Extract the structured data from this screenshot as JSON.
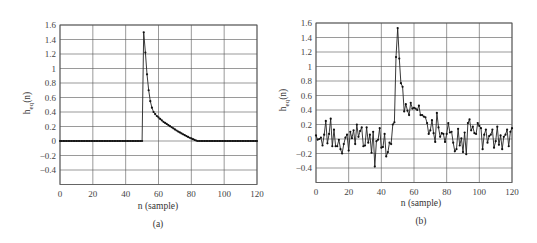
{
  "chart_data": [
    {
      "id": "a",
      "type": "line",
      "caption": "(a)",
      "title": "",
      "xlabel": "n (sample)",
      "ylabel": "h",
      "ylabel_sub": "eq",
      "ylabel_suffix": "(n)",
      "xlim": [
        0,
        120
      ],
      "ylim": [
        -0.6,
        1.6
      ],
      "xticks": [
        0,
        20,
        40,
        60,
        80,
        100,
        120
      ],
      "yticks": [
        -0.4,
        -0.2,
        0,
        0.2,
        0.4,
        0.6,
        0.8,
        1,
        1.2,
        1.4,
        1.6
      ],
      "ytick_labels": [
        "-0.4",
        "-0.2",
        "0",
        "0.2",
        "0.4",
        "0.6",
        "0.8",
        "1",
        "1.2",
        "1.4",
        "1.6"
      ],
      "grid": true,
      "legend": null,
      "marker": "dot",
      "x": [
        0,
        1,
        2,
        3,
        4,
        5,
        6,
        7,
        8,
        9,
        10,
        11,
        12,
        13,
        14,
        15,
        16,
        17,
        18,
        19,
        20,
        21,
        22,
        23,
        24,
        25,
        26,
        27,
        28,
        29,
        30,
        31,
        32,
        33,
        34,
        35,
        36,
        37,
        38,
        39,
        40,
        41,
        42,
        43,
        44,
        45,
        46,
        47,
        48,
        49,
        50,
        51,
        52,
        53,
        54,
        55,
        56,
        57,
        58,
        59,
        60,
        61,
        62,
        63,
        64,
        65,
        66,
        67,
        68,
        69,
        70,
        71,
        72,
        73,
        74,
        75,
        76,
        77,
        78,
        79,
        80,
        81,
        82,
        83,
        84,
        85,
        86,
        87,
        88,
        89,
        90,
        91,
        92,
        93,
        94,
        95,
        96,
        97,
        98,
        99,
        100,
        101,
        102,
        103,
        104,
        105,
        106,
        107,
        108,
        109,
        110,
        111,
        112,
        113,
        114,
        115,
        116,
        117,
        118,
        119,
        120
      ],
      "values": [
        0,
        0,
        0,
        0,
        0,
        0,
        0,
        0,
        0,
        0,
        0,
        0,
        0,
        0,
        0,
        0,
        0,
        0,
        0,
        0,
        0,
        0,
        0,
        0,
        0,
        0,
        0,
        0,
        0,
        0,
        0,
        0,
        0,
        0,
        0,
        0,
        0,
        0,
        0,
        0,
        0,
        0,
        0,
        0,
        0,
        0,
        0,
        0,
        0,
        0,
        0,
        1.5,
        1.22,
        0.92,
        0.7,
        0.55,
        0.46,
        0.4,
        0.37,
        0.345,
        0.325,
        0.305,
        0.285,
        0.265,
        0.25,
        0.235,
        0.22,
        0.205,
        0.19,
        0.175,
        0.16,
        0.145,
        0.13,
        0.118,
        0.105,
        0.092,
        0.08,
        0.068,
        0.056,
        0.045,
        0.035,
        0.025,
        0.015,
        0.006,
        0,
        0,
        0,
        0,
        0,
        0,
        0,
        0,
        0,
        0,
        0,
        0,
        0,
        0,
        0,
        0,
        0,
        0,
        0,
        0,
        0,
        0,
        0,
        0,
        0,
        0,
        0,
        0,
        0,
        0,
        0,
        0,
        0,
        0,
        0,
        0,
        0
      ]
    },
    {
      "id": "b",
      "type": "line",
      "caption": "(b)",
      "title": "",
      "xlabel": "n (sample)",
      "ylabel": "h",
      "ylabel_sub": "eq",
      "ylabel_suffix": "(n)",
      "xlim": [
        0,
        120
      ],
      "ylim": [
        -0.6,
        1.6
      ],
      "xticks": [
        0,
        20,
        40,
        60,
        80,
        100,
        120
      ],
      "yticks": [
        -0.4,
        -0.2,
        0,
        0.2,
        0.4,
        0.6,
        0.8,
        1,
        1.2,
        1.4,
        1.6
      ],
      "ytick_labels": [
        "-0.4",
        "-0.2",
        "0",
        "0.2",
        "0.4",
        "0.6",
        "0.8",
        "1",
        "1.2",
        "1.4",
        "1.6"
      ],
      "grid": true,
      "legend": null,
      "marker": "dot",
      "x": [
        0,
        1,
        2,
        3,
        4,
        5,
        6,
        7,
        8,
        9,
        10,
        11,
        12,
        13,
        14,
        15,
        16,
        17,
        18,
        19,
        20,
        21,
        22,
        23,
        24,
        25,
        26,
        27,
        28,
        29,
        30,
        31,
        32,
        33,
        34,
        35,
        36,
        37,
        38,
        39,
        40,
        41,
        42,
        43,
        44,
        45,
        46,
        47,
        48,
        49,
        50,
        51,
        52,
        53,
        54,
        55,
        56,
        57,
        58,
        59,
        60,
        61,
        62,
        63,
        64,
        65,
        66,
        67,
        68,
        69,
        70,
        71,
        72,
        73,
        74,
        75,
        76,
        77,
        78,
        79,
        80,
        81,
        82,
        83,
        84,
        85,
        86,
        87,
        88,
        89,
        90,
        91,
        92,
        93,
        94,
        95,
        96,
        97,
        98,
        99,
        100,
        101,
        102,
        103,
        104,
        105,
        106,
        107,
        108,
        109,
        110,
        111,
        112,
        113,
        114,
        115,
        116,
        117,
        118,
        119,
        120
      ],
      "values": [
        0.05,
        -0.01,
        0.0,
        0.02,
        -0.09,
        0.06,
        0.25,
        -0.06,
        0.07,
        0.28,
        -0.1,
        0.13,
        -0.1,
        -0.1,
        -0.01,
        -0.14,
        -0.2,
        -0.07,
        0.02,
        0.06,
        -0.16,
        0.1,
        0.01,
        0.12,
        -0.07,
        0.2,
        0.03,
        0.11,
        0.16,
        -0.1,
        -0.09,
        0.16,
        -0.05,
        0.06,
        -0.19,
        0.1,
        -0.38,
        -0.03,
        -0.01,
        0.15,
        -0.12,
        -0.11,
        0.07,
        -0.24,
        -0.18,
        -0.05,
        -0.07,
        0.2,
        0.23,
        1.13,
        1.53,
        1.11,
        0.77,
        0.72,
        0.38,
        0.48,
        0.39,
        0.33,
        0.5,
        0.42,
        0.43,
        0.42,
        0.4,
        0.46,
        0.33,
        0.33,
        0.31,
        0.3,
        0.22,
        0.07,
        0.12,
        0.26,
        0.08,
        -0.04,
        0.36,
        0.16,
        0.03,
        0.08,
        0.07,
        -0.04,
        0.07,
        0.22,
        0.09,
        0.1,
        -0.05,
        -0.17,
        -0.14,
        0.14,
        -0.09,
        0.01,
        -0.18,
        0.09,
        -0.21,
        0.22,
        0.27,
        0.12,
        0.17,
        0.08,
        0.07,
        0.22,
        0.18,
        0.15,
        -0.14,
        0.06,
        0.13,
        -0.05,
        0.04,
        0.06,
        0.13,
        -0.12,
        -0.03,
        0.17,
        -0.08,
        0.05,
        -0.14,
        0.03,
        0.06,
        0.13,
        -0.1,
        0.1,
        0.15
      ]
    }
  ],
  "figures": [
    {
      "caption": "(a)",
      "xlabel": "n (sample)",
      "ylabel_main": "h",
      "ylabel_sub": "eq",
      "ylabel_suffix": "(n)"
    },
    {
      "caption": "(b)",
      "xlabel": "n (sample)",
      "ylabel_main": "h",
      "ylabel_sub": "eq",
      "ylabel_suffix": "(n)"
    }
  ]
}
